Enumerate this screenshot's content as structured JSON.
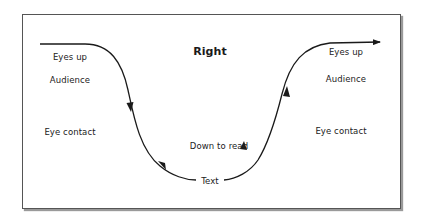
{
  "diagram": {
    "title": "Right",
    "left_column": {
      "top": "Eyes up",
      "middle": "Audience",
      "bottom": "Eye contact"
    },
    "right_column": {
      "top": "Eyes up",
      "middle": "Audience",
      "bottom": "Eye contact"
    },
    "center": {
      "caption": "Down to read",
      "trough_label": "Text"
    },
    "colors": {
      "line": "#1a1a1a",
      "frame": "#555555",
      "text": "#222222"
    }
  }
}
